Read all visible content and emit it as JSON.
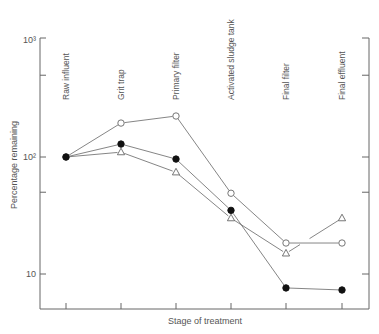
{
  "chart_data": {
    "type": "line",
    "title": "",
    "xlabel": "Stage of treatment",
    "ylabel": "Percentage remaining",
    "yscale": "log",
    "ylim": [
      5,
      1000
    ],
    "y_ticks": [
      {
        "value": 1000,
        "label": "10³"
      },
      {
        "value": 500,
        "label": ""
      },
      {
        "value": 100,
        "label": "10²"
      },
      {
        "value": 50,
        "label": ""
      },
      {
        "value": 10,
        "label": "10"
      }
    ],
    "categories": [
      "Raw influent",
      "Grit trap",
      "Primary filter",
      "Activated sludge tank",
      "Final filter",
      "Final effluent"
    ],
    "series": [
      {
        "name": "open-circle",
        "marker": "open-circle",
        "values": [
          100,
          195,
          224,
          49,
          18.4,
          18.4
        ]
      },
      {
        "name": "filled-circle",
        "marker": "filled-circle",
        "values": [
          100,
          129,
          96,
          35,
          7.6,
          7.3
        ]
      },
      {
        "name": "open-triangle",
        "marker": "open-triangle",
        "values": [
          100,
          110,
          74,
          30,
          15,
          30
        ]
      }
    ],
    "grid": false,
    "legend": "none"
  },
  "colors": {
    "line": "#666666",
    "text": "#555555",
    "background": "#ffffff"
  }
}
